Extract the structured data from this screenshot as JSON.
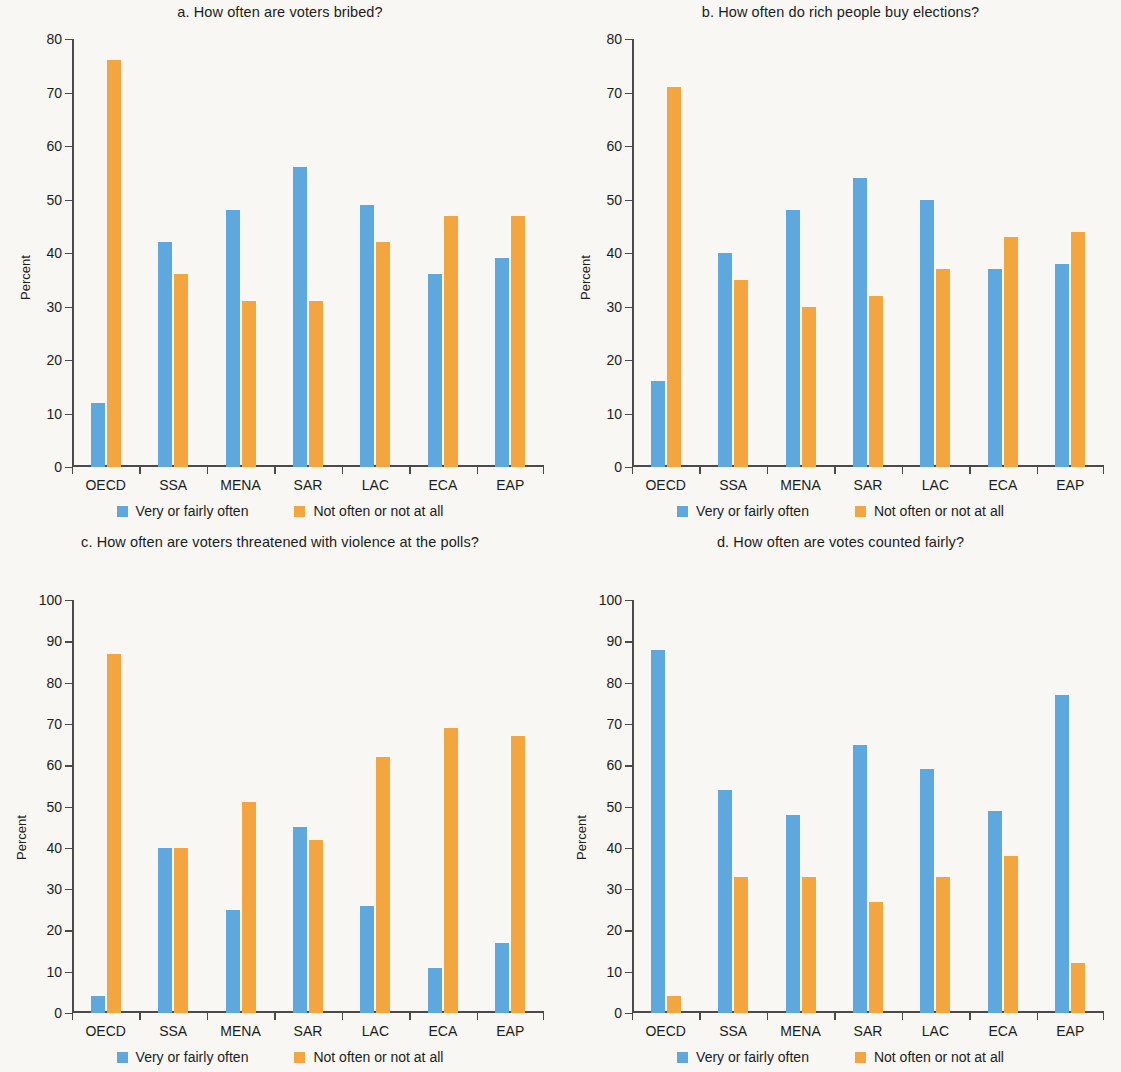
{
  "figure": {
    "percent_axis_label": "Percent",
    "legend": [
      {
        "key": "blue",
        "label": "Very or fairly often",
        "color": "#5fa8dd"
      },
      {
        "key": "orange",
        "label": "Not often or not at all",
        "color": "#f3a63f"
      }
    ]
  },
  "chart_data": [
    {
      "type": "bar",
      "panel": "a",
      "title": "a. How often are voters bribed?",
      "xlabel": "",
      "ylabel": "Percent",
      "ylim": [
        0,
        80
      ],
      "yticks": [
        0,
        10,
        20,
        30,
        40,
        50,
        60,
        70,
        80
      ],
      "grid": false,
      "legend_position": "bottom",
      "categories": [
        "OECD",
        "SSA",
        "MENA",
        "SAR",
        "LAC",
        "ECA",
        "EAP"
      ],
      "series": [
        {
          "name": "Very or fairly often",
          "color": "#5fa8dd",
          "values": [
            12,
            42,
            48,
            56,
            49,
            36,
            39
          ]
        },
        {
          "name": "Not often or not at all",
          "color": "#f3a63f",
          "values": [
            76,
            36,
            31,
            31,
            42,
            47,
            47
          ]
        }
      ]
    },
    {
      "type": "bar",
      "panel": "b",
      "title": "b. How often do rich people buy elections?",
      "xlabel": "",
      "ylabel": "Percent",
      "ylim": [
        0,
        80
      ],
      "yticks": [
        0,
        10,
        20,
        30,
        40,
        50,
        60,
        70,
        80
      ],
      "grid": false,
      "legend_position": "bottom",
      "categories": [
        "OECD",
        "SSA",
        "MENA",
        "SAR",
        "LAC",
        "ECA",
        "EAP"
      ],
      "series": [
        {
          "name": "Very or fairly often",
          "color": "#5fa8dd",
          "values": [
            16,
            40,
            48,
            54,
            50,
            37,
            38
          ]
        },
        {
          "name": "Not often or not at all",
          "color": "#f3a63f",
          "values": [
            71,
            35,
            30,
            32,
            37,
            43,
            44
          ]
        }
      ]
    },
    {
      "type": "bar",
      "panel": "c",
      "title": "c. How often are voters threatened with violence at the polls?",
      "xlabel": "",
      "ylabel": "Percent",
      "ylim": [
        0,
        100
      ],
      "yticks": [
        0,
        10,
        20,
        30,
        40,
        50,
        60,
        70,
        80,
        90,
        100
      ],
      "grid": false,
      "legend_position": "bottom",
      "categories": [
        "OECD",
        "SSA",
        "MENA",
        "SAR",
        "LAC",
        "ECA",
        "EAP"
      ],
      "series": [
        {
          "name": "Very or fairly often",
          "color": "#5fa8dd",
          "values": [
            4,
            40,
            25,
            45,
            26,
            11,
            17
          ]
        },
        {
          "name": "Not often or not at all",
          "color": "#f3a63f",
          "values": [
            87,
            40,
            51,
            42,
            62,
            69,
            67
          ]
        }
      ]
    },
    {
      "type": "bar",
      "panel": "d",
      "title": "d. How often are votes counted fairly?",
      "xlabel": "",
      "ylabel": "Percent",
      "ylim": [
        0,
        100
      ],
      "yticks": [
        0,
        10,
        20,
        30,
        40,
        50,
        60,
        70,
        80,
        90,
        100
      ],
      "grid": false,
      "legend_position": "bottom",
      "categories": [
        "OECD",
        "SSA",
        "MENA",
        "SAR",
        "LAC",
        "ECA",
        "EAP"
      ],
      "series": [
        {
          "name": "Very or fairly often",
          "color": "#5fa8dd",
          "values": [
            88,
            54,
            48,
            65,
            59,
            49,
            77
          ]
        },
        {
          "name": "Not often or not at all",
          "color": "#f3a63f",
          "values": [
            4,
            33,
            33,
            27,
            33,
            38,
            12
          ]
        }
      ]
    }
  ]
}
